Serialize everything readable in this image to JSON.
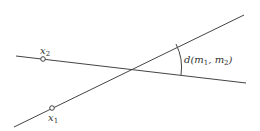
{
  "diagram": {
    "lines": [
      {
        "name": "m2",
        "x1": 16,
        "y1": 56,
        "x2": 246,
        "y2": 83
      },
      {
        "name": "m1",
        "x1": 14,
        "y1": 127,
        "x2": 244,
        "y2": 15
      }
    ],
    "points": [
      {
        "name": "x2",
        "label": "x",
        "subscript": "2",
        "cx": 43,
        "cy": 59
      },
      {
        "name": "x1",
        "label": "x",
        "subscript": "1",
        "cx": 52,
        "cy": 108
      }
    ],
    "angle_label": {
      "text_d": "d(",
      "m": "m",
      "sub1": "1",
      "comma": ", ",
      "sub2": "2",
      "close": ")"
    },
    "colors": {
      "stroke": "#444444",
      "background": "#ffffff"
    }
  }
}
